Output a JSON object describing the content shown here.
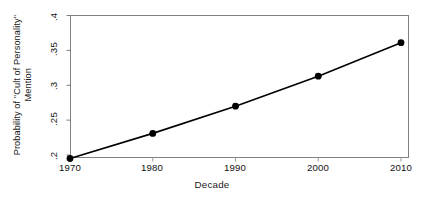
{
  "chart_data": {
    "type": "line",
    "title": "",
    "xlabel": "Decade",
    "ylabel": "Probability of \"Cult of Personality\" Mention",
    "ylabel_line1": "Probability of \"Cult of Personality\"",
    "ylabel_line2": "Mention",
    "x": [
      1970,
      1980,
      1990,
      2000,
      2010
    ],
    "values": [
      0.195,
      0.231,
      0.27,
      0.313,
      0.361
    ],
    "xticks": [
      "1970",
      "1980",
      "1990",
      "2000",
      "2010"
    ],
    "yticks": [
      ".2",
      ".25",
      ".3",
      ".35",
      ".4"
    ],
    "ytick_values": [
      0.2,
      0.25,
      0.3,
      0.35,
      0.4
    ],
    "xlim": [
      1965,
      1014
    ],
    "ylim": [
      0.19,
      0.4
    ],
    "grid": false,
    "legend": null,
    "marker": "filled-circle",
    "line_color": "#000000",
    "marker_color": "#000000",
    "frame_color": "#808080",
    "background": "#ffffff"
  }
}
